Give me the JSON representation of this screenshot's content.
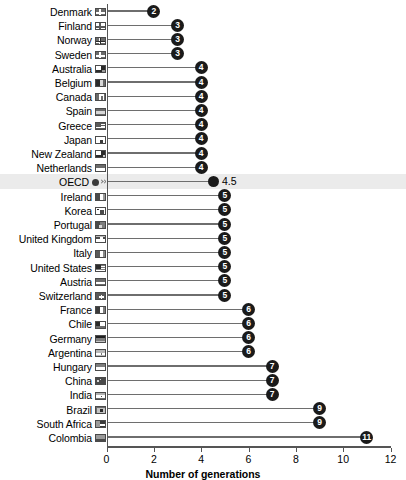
{
  "chart_data": {
    "type": "bar",
    "subtype": "lollipop-horizontal",
    "title": "",
    "xlabel": "Number of generations",
    "ylabel": "",
    "xlim": [
      0,
      12
    ],
    "xticks": [
      0,
      2,
      4,
      6,
      8,
      10,
      12
    ],
    "xticklabels": [
      "0",
      "2",
      "4",
      "6",
      "8",
      "10",
      "12"
    ],
    "grid": false,
    "legend": null,
    "highlight_category": "OECD",
    "categories": [
      "Denmark",
      "Finland",
      "Norway",
      "Sweden",
      "Australia",
      "Belgium",
      "Canada",
      "Spain",
      "Greece",
      "Japan",
      "New Zealand",
      "Netherlands",
      "OECD",
      "Ireland",
      "Korea",
      "Portugal",
      "United Kingdom",
      "Italy",
      "United States",
      "Austria",
      "Switzerland",
      "France",
      "Chile",
      "Germany",
      "Argentina",
      "Hungary",
      "China",
      "India",
      "Brazil",
      "South Africa",
      "Colombia"
    ],
    "values": [
      2,
      3,
      3,
      3,
      4,
      4,
      4,
      4,
      4,
      4,
      4,
      4,
      4.5,
      5,
      5,
      5,
      5,
      5,
      5,
      5,
      5,
      6,
      6,
      6,
      6,
      7,
      7,
      7,
      9,
      9,
      11
    ],
    "value_labels": [
      "2",
      "3",
      "3",
      "3",
      "4",
      "4",
      "4",
      "4",
      "4",
      "4",
      "4",
      "4",
      "4.5",
      "5",
      "5",
      "5",
      "5",
      "5",
      "5",
      "5",
      "5",
      "6",
      "6",
      "6",
      "6",
      "7",
      "7",
      "7",
      "9",
      "9",
      "11"
    ]
  },
  "colors": {
    "marker": "#1a1a1a",
    "stem": "#6e6e6e",
    "axis": "#555555",
    "highlight_band": "#ebebeb",
    "value_text_inside": "#ffffff",
    "value_text_outside": "#000000"
  },
  "icons": {
    "row_icon_name": "flag-icon",
    "oecd_icon_name": "oecd-globe-icon"
  }
}
